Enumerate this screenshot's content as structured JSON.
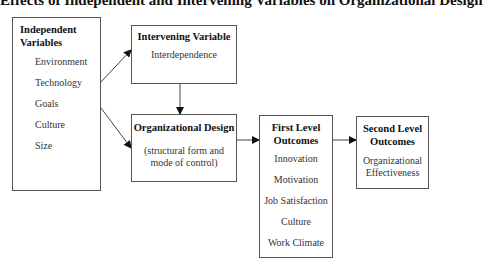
{
  "title": "Effects of Independent and Intervening Variables on Organizational Design",
  "boxes": {
    "independent": {
      "heading_line1": "Independent",
      "heading_line2": "Variables",
      "items": [
        "Environment",
        "Technology",
        "Goals",
        "Culture",
        "Size"
      ]
    },
    "intervening": {
      "heading": "Intervening Variable",
      "items": [
        "Interdependence"
      ]
    },
    "organizational_design": {
      "heading": "Organizational Design",
      "sub_line1": "(structural form and",
      "sub_line2": "mode of control)"
    },
    "first_level": {
      "heading_line1": "First Level",
      "heading_line2": "Outcomes",
      "items": [
        "Innovation",
        "Motivation",
        "Job Satisfaction",
        "Culture",
        "Work Climate"
      ]
    },
    "second_level": {
      "heading_line1": "Second Level",
      "heading_line2": "Outcomes",
      "item_line1": "Organizational",
      "item_line2": "Effectiveness"
    }
  },
  "arrows": [
    {
      "from": "independent",
      "to": "intervening"
    },
    {
      "from": "independent",
      "to": "organizational_design"
    },
    {
      "from": "intervening",
      "to": "organizational_design"
    },
    {
      "from": "organizational_design",
      "to": "first_level"
    },
    {
      "from": "first_level",
      "to": "second_level"
    }
  ],
  "colors": {
    "line": "#555555",
    "arrowhead": "#111111",
    "background": "#ffffff"
  }
}
